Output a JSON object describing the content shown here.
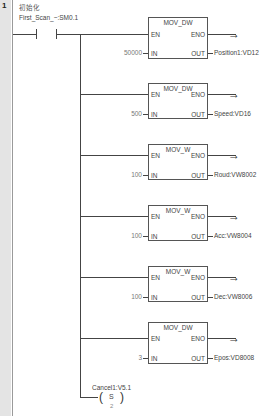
{
  "rung": {
    "number": "1",
    "comment": "初始化",
    "contact": {
      "label": "First_Scan_~:SM0.1"
    }
  },
  "blocks": [
    {
      "title": "MOV_DW",
      "en": "EN",
      "eno": "ENO",
      "in_pin": "IN",
      "out_pin": "OUT",
      "in_value": "50000",
      "out_value": "Position1:VD12"
    },
    {
      "title": "MOV_DW",
      "en": "EN",
      "eno": "ENO",
      "in_pin": "IN",
      "out_pin": "OUT",
      "in_value": "500",
      "out_value": "Speed:VD16"
    },
    {
      "title": "MOV_W",
      "en": "EN",
      "eno": "ENO",
      "in_pin": "IN",
      "out_pin": "OUT",
      "in_value": "100",
      "out_value": "Roud:VW8002"
    },
    {
      "title": "MOV_W",
      "en": "EN",
      "eno": "ENO",
      "in_pin": "IN",
      "out_pin": "OUT",
      "in_value": "100",
      "out_value": "Acc:VW8004"
    },
    {
      "title": "MOV_W",
      "en": "EN",
      "eno": "ENO",
      "in_pin": "IN",
      "out_pin": "OUT",
      "in_value": "100",
      "out_value": "Dec:VW8006"
    },
    {
      "title": "MOV_DW",
      "en": "EN",
      "eno": "ENO",
      "in_pin": "IN",
      "out_pin": "OUT",
      "in_value": "3",
      "out_value": "Epos:VD8008"
    }
  ],
  "coil": {
    "label": "Cancel1:V5.1",
    "type": "S",
    "count": "2",
    "left_paren": "(",
    "right_paren": ")"
  },
  "icons": {
    "arrow": "→"
  }
}
